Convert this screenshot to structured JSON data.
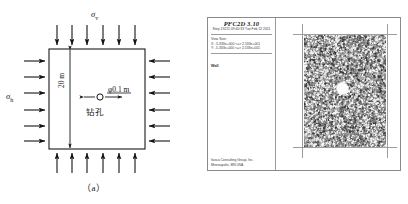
{
  "figure": {
    "panel_a": {
      "caption": "（a）",
      "stress_vertical_label": "σ",
      "stress_vertical_sub": "v",
      "stress_horizontal_label": "σ",
      "stress_horizontal_sub": "h",
      "height_label": "20 m",
      "hole_diameter_label": "φ0.1 m",
      "hole_name_label": "钻孔",
      "arrow_count_top": 6,
      "arrow_count_bottom": 6,
      "arrow_count_left": 6,
      "arrow_count_right": 6,
      "line_color": "#1a1a1a"
    },
    "panel_b": {
      "caption": "（b）",
      "app_title": "PFC2D 3.10",
      "step_line": "Step 19221  09:40:33 Tue Feb 22 2011",
      "view_info_header": "View Size:",
      "view_info_x": "X: -5.333e+000 <=> 2.533e+001",
      "view_info_y": "Y: -5.333e+000 <=> 2.533e+001",
      "legend_label": "Wall",
      "footer_line1": "Itasca Consulting Group, Inc.",
      "footer_line2": "Minneapolis, MN  USA",
      "particle_fill_color": "#8f8f8f",
      "wall_color": "#9d9d9d",
      "border_color": "#8a8a8a"
    }
  }
}
